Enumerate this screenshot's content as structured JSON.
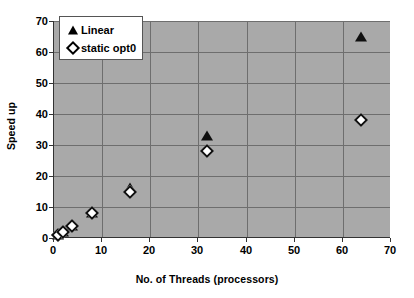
{
  "chart_data": {
    "type": "scatter",
    "title": "",
    "xlabel": "No. of Threads (processors)",
    "ylabel": "Speed up",
    "xlim": [
      0,
      70
    ],
    "ylim": [
      0,
      70
    ],
    "xticks": [
      0,
      10,
      20,
      30,
      40,
      50,
      60,
      70
    ],
    "yticks": [
      0,
      10,
      20,
      30,
      40,
      50,
      60,
      70
    ],
    "grid": true,
    "legend_position": "top-left",
    "plot_background": "#a9a9a9",
    "series": [
      {
        "name": "Linear",
        "marker": "filled-triangle",
        "color": "#101010",
        "x": [
          1,
          2,
          4,
          8,
          16,
          32,
          64
        ],
        "y": [
          1,
          2,
          4,
          8,
          16,
          33,
          65
        ]
      },
      {
        "name": "static opt0",
        "marker": "open-diamond",
        "color": "#101010",
        "x": [
          1,
          2,
          4,
          8,
          16,
          32,
          64
        ],
        "y": [
          1,
          2,
          4,
          8,
          15,
          28,
          38
        ]
      }
    ]
  },
  "legend": {
    "items": [
      {
        "label": "Linear",
        "marker": "filled-triangle"
      },
      {
        "label": "static opt0",
        "marker": "open-diamond"
      }
    ]
  }
}
